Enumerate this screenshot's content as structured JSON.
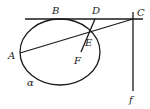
{
  "diagram": {
    "title": "",
    "colors": {
      "stroke": "#1a1a1a",
      "label": "#222222",
      "background": "#ffffff"
    },
    "labels": {
      "A": "A",
      "B": "B",
      "C": "C",
      "D": "D",
      "E": "E",
      "F": "F",
      "alpha": "α",
      "f": "f"
    },
    "elements": [
      {
        "type": "ellipse",
        "name": "α",
        "center": [
          60,
          52
        ],
        "rx": 40,
        "ry": 33
      },
      {
        "type": "line",
        "name": "BC tangent line",
        "from": [
          25,
          19
        ],
        "to": [
          143,
          19
        ]
      },
      {
        "type": "line",
        "name": "f",
        "from": [
          133,
          12
        ],
        "to": [
          133,
          91
        ]
      },
      {
        "type": "segment",
        "name": "AC",
        "from": [
          20,
          53
        ],
        "to": [
          133,
          19
        ]
      },
      {
        "type": "segment",
        "name": "DF",
        "from": [
          95,
          20
        ],
        "to": [
          81,
          52
        ]
      }
    ],
    "points": {
      "A": [
        20,
        53
      ],
      "B": [
        58,
        19
      ],
      "C": [
        133,
        19
      ],
      "D": [
        95,
        19
      ],
      "E": [
        90,
        32
      ],
      "F": [
        81,
        52
      ]
    }
  }
}
